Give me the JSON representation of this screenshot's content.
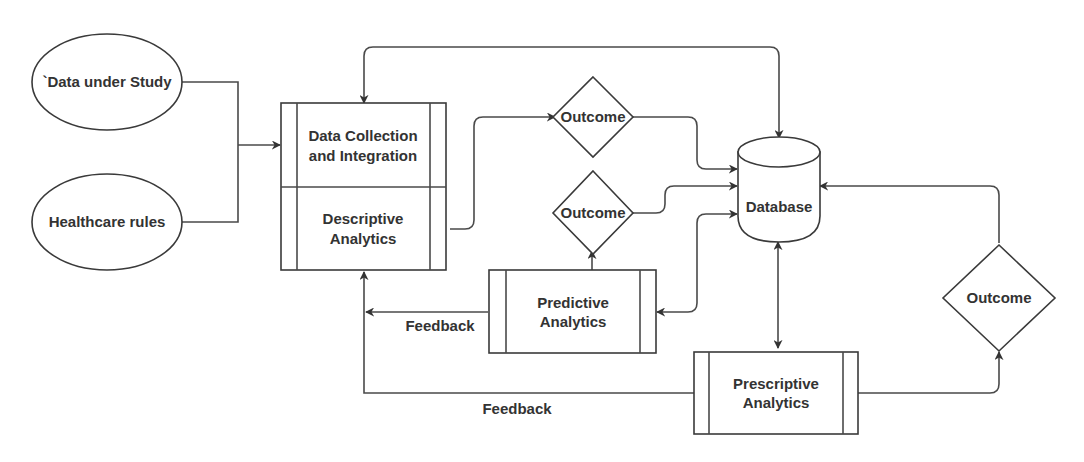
{
  "diagram": {
    "inputs": {
      "data_under_study": "`Data under Study",
      "healthcare_rules": "Healthcare rules"
    },
    "processes": {
      "data_collection": [
        "Data Collection",
        "and Integration"
      ],
      "descriptive": [
        "Descriptive",
        "Analytics"
      ],
      "predictive": [
        "Predictive",
        "Analytics"
      ],
      "prescriptive": [
        "Prescriptive",
        "Analytics"
      ]
    },
    "decisions": {
      "outcome_top": "Outcome",
      "outcome_middle": "Outcome",
      "outcome_right": "Outcome"
    },
    "datastore": {
      "database": "Database"
    },
    "edge_labels": {
      "feedback_predictive": "Feedback",
      "feedback_prescriptive": "Feedback"
    },
    "colors": {
      "stroke": "#3a3a3a",
      "text": "#333333",
      "background": "#ffffff"
    }
  }
}
